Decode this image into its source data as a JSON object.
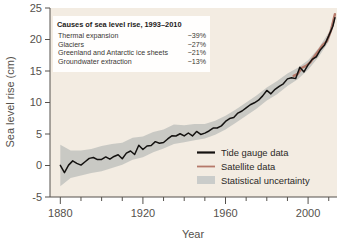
{
  "chart_data": {
    "type": "line",
    "title": "",
    "xlabel": "Year",
    "ylabel": "Sea level rise (cm)",
    "xlim": [
      1875,
      2014
    ],
    "ylim": [
      -5,
      25
    ],
    "xticks": [
      1880,
      1920,
      1960,
      2000
    ],
    "xtick_labels": [
      "1880",
      "1920",
      "1960",
      "2000"
    ],
    "xminor_step": 10,
    "yticks": [
      -5,
      0,
      5,
      10,
      15,
      20,
      25
    ],
    "ytick_labels": [
      "-5",
      "0",
      "5",
      "10",
      "15",
      "20",
      "25"
    ],
    "grid": false,
    "legend_position": "lower-right",
    "plot_bg": "#f3ece2",
    "series": [
      {
        "name": "Tide gauge data",
        "color": "#141210",
        "x": [
          1880,
          1882,
          1884,
          1886,
          1888,
          1890,
          1892,
          1894,
          1896,
          1898,
          1900,
          1902,
          1904,
          1906,
          1908,
          1910,
          1912,
          1914,
          1916,
          1918,
          1920,
          1922,
          1924,
          1926,
          1928,
          1930,
          1932,
          1934,
          1936,
          1938,
          1940,
          1942,
          1944,
          1946,
          1948,
          1950,
          1952,
          1954,
          1956,
          1958,
          1960,
          1962,
          1964,
          1966,
          1968,
          1970,
          1972,
          1974,
          1976,
          1978,
          1980,
          1982,
          1984,
          1986,
          1988,
          1990,
          1992,
          1994,
          1996,
          1998,
          2000,
          2002,
          2004,
          2006,
          2008,
          2010,
          2012,
          2013
        ],
        "values": [
          0.2,
          -1.4,
          0.3,
          0.8,
          0.6,
          0.3,
          0.5,
          0.9,
          1.1,
          0.8,
          1.2,
          1.3,
          1.0,
          1.6,
          1.5,
          1.3,
          1.8,
          2.5,
          2.0,
          3.1,
          2.4,
          2.9,
          3.0,
          3.6,
          3.4,
          3.9,
          4.3,
          4.9,
          4.6,
          5.1,
          4.8,
          5.0,
          4.8,
          5.2,
          4.9,
          5.3,
          5.5,
          5.9,
          6.0,
          6.4,
          6.8,
          7.4,
          7.7,
          8.2,
          8.6,
          9.2,
          9.6,
          10.1,
          10.6,
          11.0,
          11.9,
          11.4,
          12.2,
          12.6,
          13.2,
          13.6,
          14.1,
          14.0,
          15.4,
          14.8,
          15.9,
          16.6,
          17.4,
          18.4,
          19.2,
          20.5,
          22.0,
          23.6
        ]
      },
      {
        "name": "Satellite data",
        "color": "#b5796a",
        "x": [
          1993,
          1995,
          1997,
          1999,
          2001,
          2003,
          2005,
          2007,
          2009,
          2011,
          2013
        ],
        "values": [
          14.2,
          14.6,
          15.5,
          15.7,
          16.3,
          17.3,
          18.1,
          19.0,
          19.8,
          21.2,
          24.1
        ]
      }
    ],
    "uncertainty": {
      "name": "Statistical uncertainty",
      "color": "#b9bbb9",
      "x": [
        1880,
        1885,
        1890,
        1895,
        1900,
        1905,
        1910,
        1915,
        1920,
        1925,
        1930,
        1935,
        1940,
        1945,
        1950,
        1955,
        1960,
        1965,
        1970,
        1975,
        1980,
        1985,
        1990,
        1995,
        2000,
        2005,
        2010,
        2013
      ],
      "lower": [
        -3.3,
        -2.0,
        -1.6,
        -1.2,
        -0.9,
        -0.4,
        0.1,
        0.9,
        1.3,
        2.1,
        2.7,
        3.4,
        3.7,
        4.0,
        4.3,
        4.9,
        5.7,
        6.8,
        7.9,
        9.0,
        10.3,
        11.3,
        12.6,
        13.7,
        15.2,
        17.2,
        19.7,
        23.0
      ],
      "upper": [
        3.3,
        2.4,
        2.4,
        2.6,
        3.1,
        3.4,
        3.6,
        4.4,
        4.6,
        5.3,
        5.7,
        6.5,
        6.4,
        6.6,
        6.6,
        7.1,
        7.9,
        8.9,
        10.0,
        11.1,
        12.4,
        13.4,
        14.6,
        15.5,
        16.7,
        18.6,
        21.1,
        24.2
      ]
    },
    "annotation_box": {
      "title": "Causes of sea level rise, 1993–2010",
      "rows": [
        {
          "label": "Thermal expansion",
          "value": "~39%"
        },
        {
          "label": "Glaciers",
          "value": "~27%"
        },
        {
          "label": "Greenland and Antarctic ice sheets",
          "value": "~21%"
        },
        {
          "label": "Groundwater extraction",
          "value": "~13%"
        }
      ]
    },
    "legend": [
      {
        "label": "Tide gauge data",
        "type": "line",
        "color": "#141210"
      },
      {
        "label": "Satellite data",
        "type": "line",
        "color": "#b5796a"
      },
      {
        "label": "Statistical uncertainty",
        "type": "swatch",
        "color": "#c2c7c6"
      }
    ]
  }
}
